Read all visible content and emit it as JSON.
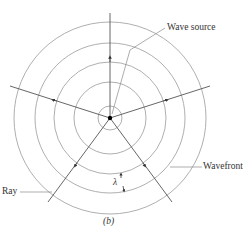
{
  "figure": {
    "caption": "(b)",
    "labels": {
      "wave_source": "Wave source",
      "wavefront": "Wavefront",
      "ray": "Ray",
      "wavelength": "λ"
    },
    "geometry": {
      "center": [
        110,
        118
      ],
      "radii": [
        12,
        36,
        56,
        75,
        96
      ]
    },
    "colors": {
      "circle": "#9a9a9a",
      "ray": "#555555",
      "source": "#000000"
    }
  }
}
